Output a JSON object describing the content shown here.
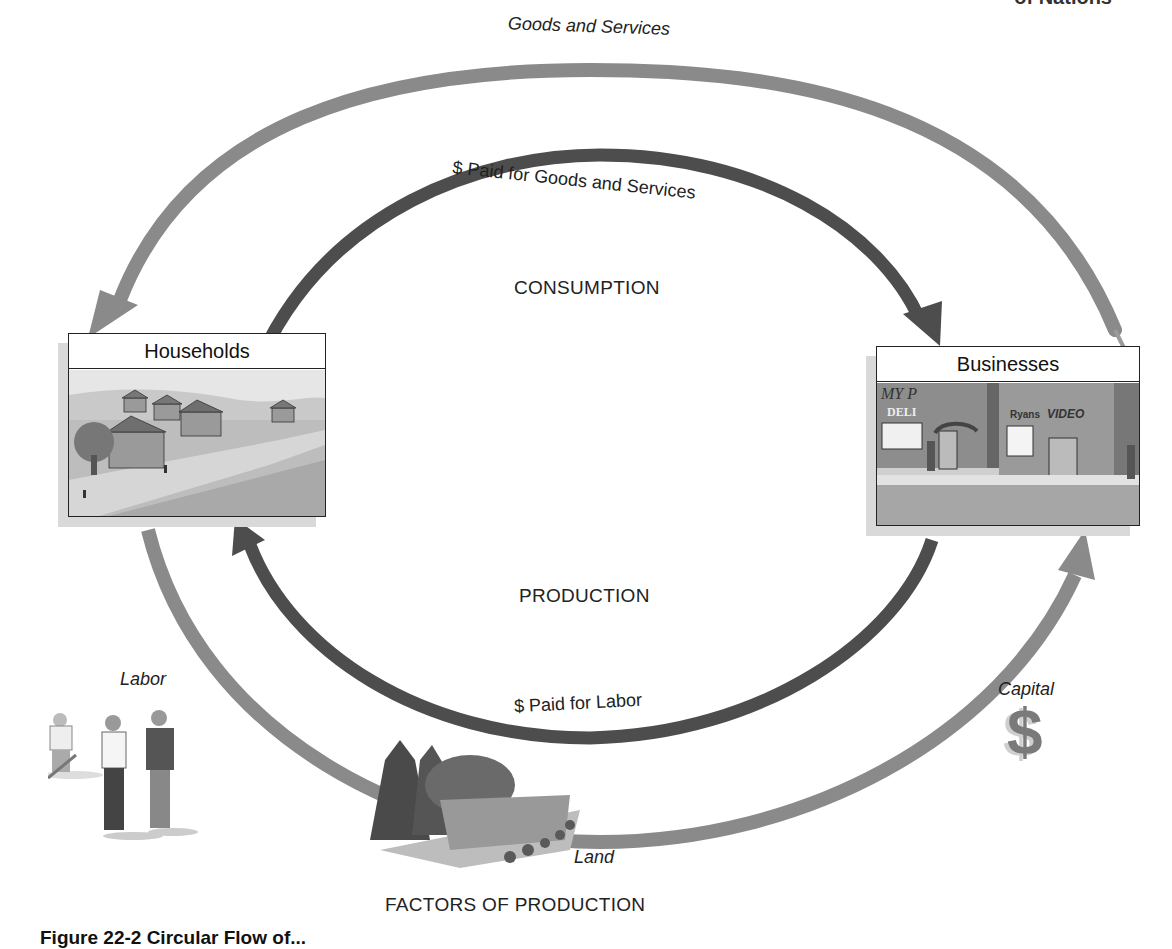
{
  "header": {
    "running_head": "of Nations"
  },
  "diagram": {
    "title_bottom": "FACTORS OF PRODUCTION",
    "center_labels": {
      "consumption": "CONSUMPTION",
      "production": "PRODUCTION"
    },
    "flows": {
      "outer_top": "Goods and Services",
      "inner_top": "$ Paid for Goods and Services",
      "inner_bottom": "$ Paid for Labor"
    },
    "nodes": {
      "households": "Households",
      "businesses": "Businesses"
    },
    "factors": {
      "labor": "Labor",
      "land": "Land",
      "capital": "Capital",
      "capital_symbol": "$"
    },
    "business_signs": {
      "deli": "DELI",
      "my": "MY P",
      "video_brand": "Ryans",
      "video": "VIDEO"
    },
    "colors": {
      "outer_arrow": "#8a8a8a",
      "inner_arrow": "#4d4d4d",
      "box_border": "#222222",
      "shadow": "#d9d9d9"
    }
  },
  "caption": {
    "text": "Figure 22-2 Circular Flow of..."
  }
}
